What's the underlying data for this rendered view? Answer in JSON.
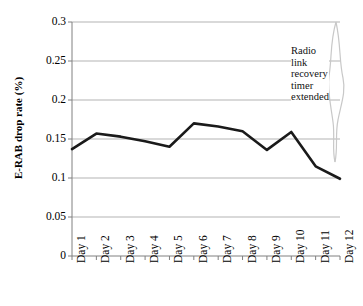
{
  "chart_data": {
    "type": "line",
    "title": "",
    "xlabel": "",
    "ylabel": "E-RAB drop rate (%)",
    "categories": [
      "Day 1",
      "Day 2",
      "Day 3",
      "Day 4",
      "Day 5",
      "Day 6",
      "Day 7",
      "Day 8",
      "Day 9",
      "Day 10",
      "Day 11",
      "Day 12"
    ],
    "values": [
      0.137,
      0.157,
      0.153,
      0.147,
      0.14,
      0.17,
      0.166,
      0.16,
      0.136,
      0.159,
      0.115,
      0.099
    ],
    "series": [
      {
        "name": "E-RAB drop rate",
        "values": [
          0.137,
          0.157,
          0.153,
          0.147,
          0.14,
          0.17,
          0.166,
          0.16,
          0.136,
          0.159,
          0.115,
          0.099
        ]
      }
    ],
    "ylim": [
      0,
      0.3
    ],
    "ytick_labels": [
      "0",
      "0.05",
      "0.1",
      "0.15",
      "0.2",
      "0.25",
      "0.3"
    ],
    "ytick_values": [
      0,
      0.05,
      0.1,
      0.15,
      0.2,
      0.25,
      0.3
    ],
    "grid": true,
    "legend": false,
    "legend_position": "none",
    "line_color": "#1a1a1a",
    "gridline_color": "#b3b3b3",
    "axis_color": "#808080",
    "annotations": [
      {
        "id": "radio-link-annotation",
        "lines": [
          "Radio",
          "link",
          "recovery",
          "timer",
          "extended"
        ],
        "text": "Radio link recovery timer extended",
        "bracket": true,
        "bracket_color": "#c8c8c8"
      }
    ]
  }
}
